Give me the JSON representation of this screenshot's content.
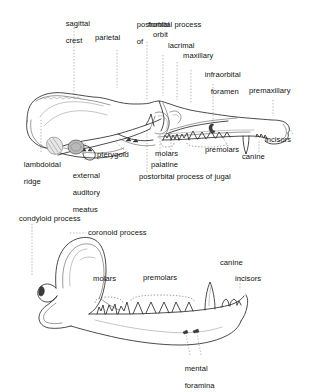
{
  "figure": {
    "panels": [
      {
        "id": "skull",
        "name": "lateral-skull-view",
        "labels": [
          {
            "id": "sagittal-crest",
            "lines": [
              "sagittal",
              "crest"
            ]
          },
          {
            "id": "parietal",
            "lines": [
              "parietal"
            ]
          },
          {
            "id": "postorbital-process-of",
            "lines": [
              "postorbital process",
              "of"
            ]
          },
          {
            "id": "frontal",
            "lines": [
              "frontal"
            ]
          },
          {
            "id": "orbit",
            "lines": [
              "orbit"
            ]
          },
          {
            "id": "lacrimal",
            "lines": [
              "lacrimal"
            ]
          },
          {
            "id": "maxillary",
            "lines": [
              "maxillary"
            ]
          },
          {
            "id": "infraorbital-foramen",
            "lines": [
              "infraorbital",
              "foramen"
            ]
          },
          {
            "id": "premaxillary",
            "lines": [
              "premaxillary"
            ]
          },
          {
            "id": "incisors",
            "lines": [
              "incisors"
            ]
          },
          {
            "id": "canine",
            "lines": [
              "canine"
            ]
          },
          {
            "id": "premolars",
            "lines": [
              "premolars"
            ]
          },
          {
            "id": "molars",
            "lines": [
              "molars"
            ]
          },
          {
            "id": "palatine",
            "lines": [
              "palatine"
            ]
          },
          {
            "id": "postorbital-process-of-jugal",
            "lines": [
              "postorbital process of jugal"
            ]
          },
          {
            "id": "pterygoid",
            "lines": [
              "pterygoid"
            ]
          },
          {
            "id": "external-auditory-meatus",
            "lines": [
              "external",
              "auditory",
              "meatus"
            ]
          },
          {
            "id": "lambdoidal-ridge",
            "lines": [
              "lambdoidal",
              "ridge"
            ]
          }
        ]
      },
      {
        "id": "mandible",
        "name": "mandible-view",
        "labels": [
          {
            "id": "condyloid-process",
            "lines": [
              "condyloid process"
            ]
          },
          {
            "id": "coronoid-process",
            "lines": [
              "coronoid process"
            ]
          },
          {
            "id": "molars",
            "lines": [
              "molars"
            ]
          },
          {
            "id": "premolars",
            "lines": [
              "premolars"
            ]
          },
          {
            "id": "canine",
            "lines": [
              "canine"
            ]
          },
          {
            "id": "incisors",
            "lines": [
              "incisors"
            ]
          },
          {
            "id": "mental-foramina",
            "lines": [
              "mental",
              "foramina"
            ]
          }
        ]
      }
    ],
    "colors": {
      "background": "#ffffff",
      "outline": "#2a2a2a",
      "leader": "#9a9a9a",
      "text": "#111111",
      "shading": "#b9b9b9"
    }
  }
}
